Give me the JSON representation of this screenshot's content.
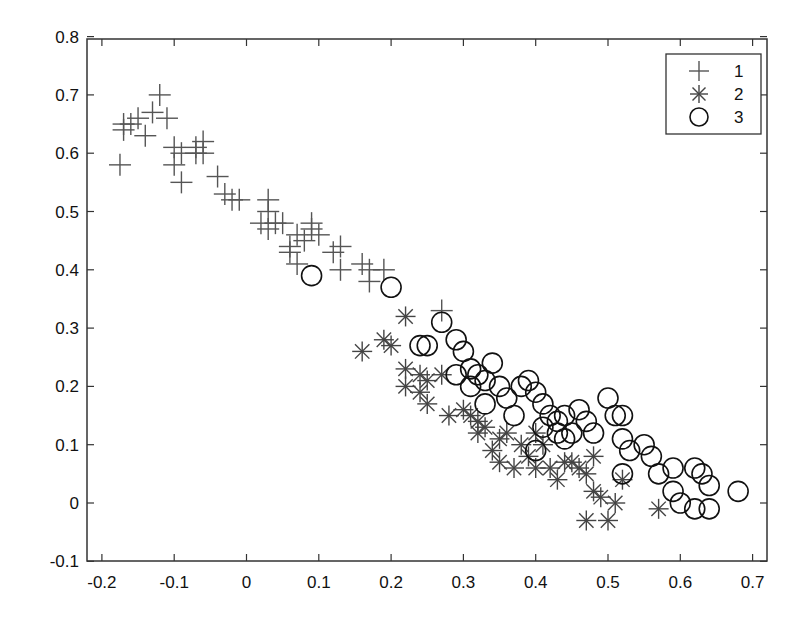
{
  "chart_data": {
    "type": "scatter",
    "title": "",
    "xlabel": "",
    "ylabel": "",
    "xlim": [
      -0.23,
      0.72
    ],
    "ylim": [
      -0.1,
      0.8
    ],
    "xticks": [
      -0.2,
      -0.1,
      0,
      0.1,
      0.2,
      0.3,
      0.4,
      0.5,
      0.6,
      0.7
    ],
    "xtick_labels": [
      "-0.2",
      "-0.1",
      "0",
      "0.1",
      "0.2",
      "0.3",
      "0.4",
      "0.5",
      "0.6",
      "0.7"
    ],
    "yticks": [
      -0.1,
      0,
      0.1,
      0.2,
      0.3,
      0.4,
      0.5,
      0.6,
      0.7,
      0.8
    ],
    "ytick_labels": [
      "-0.1",
      "0",
      "0.1",
      "0.2",
      "0.3",
      "0.4",
      "0.5",
      "0.6",
      "0.7",
      "0.8"
    ],
    "grid": false,
    "legend_position": "upper right",
    "series": [
      {
        "name": "1",
        "marker": "plus",
        "color": "#555555",
        "points": [
          [
            -0.17,
            0.65
          ],
          [
            -0.16,
            0.65
          ],
          [
            -0.17,
            0.64
          ],
          [
            -0.15,
            0.66
          ],
          [
            -0.12,
            0.7
          ],
          [
            -0.13,
            0.67
          ],
          [
            -0.11,
            0.66
          ],
          [
            -0.14,
            0.63
          ],
          [
            -0.175,
            0.58
          ],
          [
            -0.1,
            0.61
          ],
          [
            -0.09,
            0.6
          ],
          [
            -0.1,
            0.58
          ],
          [
            -0.09,
            0.55
          ],
          [
            -0.07,
            0.61
          ],
          [
            -0.06,
            0.62
          ],
          [
            -0.07,
            0.6
          ],
          [
            -0.06,
            0.6
          ],
          [
            -0.04,
            0.56
          ],
          [
            -0.03,
            0.53
          ],
          [
            -0.02,
            0.52
          ],
          [
            -0.01,
            0.52
          ],
          [
            0.02,
            0.48
          ],
          [
            0.03,
            0.5
          ],
          [
            0.03,
            0.47
          ],
          [
            0.04,
            0.48
          ],
          [
            0.03,
            0.52
          ],
          [
            0.05,
            0.48
          ],
          [
            0.06,
            0.44
          ],
          [
            0.06,
            0.43
          ],
          [
            0.07,
            0.46
          ],
          [
            0.08,
            0.45
          ],
          [
            0.09,
            0.47
          ],
          [
            0.09,
            0.48
          ],
          [
            0.1,
            0.46
          ],
          [
            0.07,
            0.41
          ],
          [
            0.12,
            0.43
          ],
          [
            0.13,
            0.44
          ],
          [
            0.13,
            0.4
          ],
          [
            0.16,
            0.41
          ],
          [
            0.17,
            0.4
          ],
          [
            0.17,
            0.38
          ],
          [
            0.19,
            0.4
          ],
          [
            0.27,
            0.33
          ]
        ]
      },
      {
        "name": "2",
        "marker": "asterisk",
        "color": "#444444",
        "points": [
          [
            0.16,
            0.26
          ],
          [
            0.19,
            0.28
          ],
          [
            0.2,
            0.27
          ],
          [
            0.22,
            0.32
          ],
          [
            0.22,
            0.23
          ],
          [
            0.22,
            0.2
          ],
          [
            0.24,
            0.19
          ],
          [
            0.24,
            0.22
          ],
          [
            0.25,
            0.17
          ],
          [
            0.25,
            0.21
          ],
          [
            0.27,
            0.22
          ],
          [
            0.28,
            0.15
          ],
          [
            0.3,
            0.16
          ],
          [
            0.31,
            0.15
          ],
          [
            0.32,
            0.14
          ],
          [
            0.32,
            0.12
          ],
          [
            0.33,
            0.13
          ],
          [
            0.34,
            0.09
          ],
          [
            0.35,
            0.11
          ],
          [
            0.35,
            0.07
          ],
          [
            0.36,
            0.12
          ],
          [
            0.37,
            0.06
          ],
          [
            0.38,
            0.1
          ],
          [
            0.39,
            0.08
          ],
          [
            0.4,
            0.12
          ],
          [
            0.4,
            0.06
          ],
          [
            0.41,
            0.1
          ],
          [
            0.42,
            0.06
          ],
          [
            0.43,
            0.04
          ],
          [
            0.44,
            0.07
          ],
          [
            0.45,
            0.07
          ],
          [
            0.46,
            0.06
          ],
          [
            0.47,
            0.05
          ],
          [
            0.48,
            0.08
          ],
          [
            0.48,
            0.02
          ],
          [
            0.49,
            0.01
          ],
          [
            0.47,
            -0.03
          ],
          [
            0.5,
            -0.03
          ],
          [
            0.51,
            0.0
          ],
          [
            0.52,
            0.04
          ],
          [
            0.57,
            -0.01
          ]
        ]
      },
      {
        "name": "3",
        "marker": "circle",
        "color": "#111111",
        "points": [
          [
            0.09,
            0.39
          ],
          [
            0.2,
            0.37
          ],
          [
            0.27,
            0.31
          ],
          [
            0.24,
            0.27
          ],
          [
            0.25,
            0.27
          ],
          [
            0.29,
            0.28
          ],
          [
            0.3,
            0.26
          ],
          [
            0.31,
            0.23
          ],
          [
            0.32,
            0.22
          ],
          [
            0.34,
            0.24
          ],
          [
            0.33,
            0.21
          ],
          [
            0.35,
            0.2
          ],
          [
            0.29,
            0.22
          ],
          [
            0.31,
            0.2
          ],
          [
            0.33,
            0.17
          ],
          [
            0.36,
            0.18
          ],
          [
            0.38,
            0.2
          ],
          [
            0.39,
            0.21
          ],
          [
            0.4,
            0.19
          ],
          [
            0.41,
            0.17
          ],
          [
            0.42,
            0.15
          ],
          [
            0.43,
            0.14
          ],
          [
            0.44,
            0.15
          ],
          [
            0.43,
            0.12
          ],
          [
            0.44,
            0.11
          ],
          [
            0.45,
            0.12
          ],
          [
            0.46,
            0.16
          ],
          [
            0.47,
            0.14
          ],
          [
            0.48,
            0.12
          ],
          [
            0.5,
            0.18
          ],
          [
            0.51,
            0.15
          ],
          [
            0.52,
            0.15
          ],
          [
            0.52,
            0.11
          ],
          [
            0.53,
            0.09
          ],
          [
            0.55,
            0.1
          ],
          [
            0.56,
            0.08
          ],
          [
            0.57,
            0.05
          ],
          [
            0.59,
            0.06
          ],
          [
            0.59,
            0.02
          ],
          [
            0.6,
            0.0
          ],
          [
            0.62,
            0.06
          ],
          [
            0.63,
            0.05
          ],
          [
            0.64,
            0.03
          ],
          [
            0.62,
            -0.01
          ],
          [
            0.64,
            -0.01
          ],
          [
            0.68,
            0.02
          ],
          [
            0.52,
            0.05
          ],
          [
            0.4,
            0.09
          ],
          [
            0.41,
            0.13
          ],
          [
            0.37,
            0.15
          ]
        ]
      }
    ]
  },
  "layout": {
    "plot_box": {
      "left": 87,
      "top": 39,
      "right": 767,
      "bottom": 561
    },
    "x_origin_px": 246.5,
    "x_px_per_unit": 723,
    "y_origin_px": 503,
    "y_px_per_unit": 583
  },
  "legend": {
    "items": [
      {
        "label": "1",
        "marker": "plus"
      },
      {
        "label": "2",
        "marker": "asterisk"
      },
      {
        "label": "3",
        "marker": "circle"
      }
    ]
  }
}
